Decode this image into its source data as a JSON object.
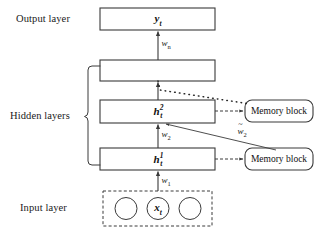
{
  "diagram": {
    "colors": {
      "stroke": "#3a3a3a",
      "text": "#111111",
      "background": "#ffffff"
    },
    "side_labels": [
      {
        "id": "output-layer",
        "text": "Output layer"
      },
      {
        "id": "hidden-layers",
        "text": "Hidden layers"
      },
      {
        "id": "input-layer",
        "text": "Input layer"
      }
    ],
    "layers": [
      {
        "id": "output-layer-box",
        "label_html": "y<sub>t</sub>",
        "label_plain": "y_t"
      },
      {
        "id": "hidden-layer-top-box",
        "label_html": "",
        "label_plain": ""
      },
      {
        "id": "hidden-layer-2-box",
        "label_html": "h<sup>2</sup><sub>t</sub>",
        "label_plain": "h_t^2"
      },
      {
        "id": "hidden-layer-1-box",
        "label_html": "h<sup>1</sup><sub>t</sub>",
        "label_plain": "h_t^1"
      }
    ],
    "memory_blocks": [
      {
        "id": "memory-block-upper",
        "label": "Memory block"
      },
      {
        "id": "memory-block-lower",
        "label": "Memory block"
      }
    ],
    "weights": [
      {
        "id": "weight-wn",
        "label_html": "w<sub>n</sub>",
        "label_plain": "w_n"
      },
      {
        "id": "weight-w2",
        "label_html": "w<sub>2</sub>",
        "label_plain": "w_2"
      },
      {
        "id": "weight-w1",
        "label_html": "w<sub>1</sub>",
        "label_plain": "w_1"
      },
      {
        "id": "weight-w2-tilde",
        "label_html": "w̃<sub>2</sub>",
        "label_plain": "w~_2"
      }
    ],
    "input_nodes": [
      {
        "id": "input-node-left",
        "label": ""
      },
      {
        "id": "input-node-center",
        "label_html": "x<sub>t</sub>",
        "label_plain": "x_t"
      },
      {
        "id": "input-node-right",
        "label": ""
      }
    ]
  }
}
